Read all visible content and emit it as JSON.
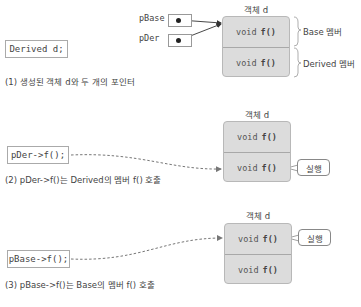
{
  "panel1": {
    "declaration": "Derived d;",
    "object_title": "객체 d",
    "pointers": [
      {
        "label": "pBase"
      },
      {
        "label": "pDer"
      }
    ],
    "members": [
      {
        "prefix": "void",
        "func": "f()"
      },
      {
        "prefix": "void",
        "func": "f()"
      }
    ],
    "brackets": [
      {
        "label": "Base 멤버"
      },
      {
        "label": "Derived 멤버"
      }
    ],
    "caption": "(1) 생성된 객체 d와 두 개의 포인터"
  },
  "panel2": {
    "call": "pDer->f();",
    "object_title": "객체 d",
    "members": [
      {
        "prefix": "void",
        "func": "f()"
      },
      {
        "prefix": "void",
        "func": "f()"
      }
    ],
    "callout": "실행",
    "executed_member_index": 1,
    "caption": "(2) pDer->f()는 Derived의 멤버 f() 호출"
  },
  "panel3": {
    "call": "pBase->f();",
    "object_title": "객체 d",
    "members": [
      {
        "prefix": "void",
        "func": "f()"
      },
      {
        "prefix": "void",
        "func": "f()"
      }
    ],
    "callout": "실행",
    "executed_member_index": 0,
    "caption": "(3) pBase->f()는 Base의 멤버 f() 호출"
  },
  "colors": {
    "object_fill": "#dcdcdc",
    "object_border": "#b8b8b8",
    "text": "#444444",
    "arrow": "#555555"
  }
}
